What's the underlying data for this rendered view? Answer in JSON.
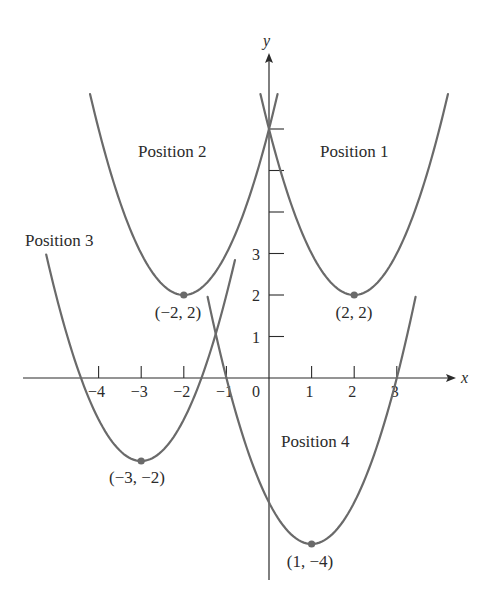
{
  "figure": {
    "axes": {
      "x_label": "x",
      "y_label": "y",
      "x_ticks": [
        {
          "value": -4,
          "label": "−4"
        },
        {
          "value": -3,
          "label": "−3"
        },
        {
          "value": -2,
          "label": "−2"
        },
        {
          "value": -1,
          "label": "−1"
        },
        {
          "value": 0,
          "label": "0"
        },
        {
          "value": 1,
          "label": "1"
        },
        {
          "value": 2,
          "label": "2"
        },
        {
          "value": 3,
          "label": "3"
        }
      ],
      "y_ticks": [
        {
          "value": 1,
          "label": "1"
        },
        {
          "value": 2,
          "label": "2"
        },
        {
          "value": 3,
          "label": "3"
        },
        {
          "value": 4,
          "label": ""
        },
        {
          "value": 5,
          "label": ""
        },
        {
          "value": 6,
          "label": ""
        }
      ],
      "x_range": [
        -5.8,
        4.4
      ],
      "y_range": [
        -4.9,
        7.9
      ]
    },
    "curves": [
      {
        "name": "Position 1",
        "label": "Position 1",
        "equation": "y = (x - 2)^2 + 2",
        "h": 2,
        "k": 2,
        "x_from": -0.2,
        "x_to": 4.2,
        "vertex_label": "(2, 2)"
      },
      {
        "name": "Position 2",
        "label": "Position 2",
        "equation": "y = (x + 2)^2 + 2",
        "h": -2,
        "k": 2,
        "x_from": -4.2,
        "x_to": 0.2,
        "vertex_label": "(−2, 2)"
      },
      {
        "name": "Position 3",
        "label": "Position 3",
        "equation": "y = (x + 3)^2 - 2",
        "h": -3,
        "k": -2,
        "x_from": -5.23,
        "x_to": -0.8,
        "vertex_label": "(−3, −2)"
      },
      {
        "name": "Position 4",
        "label": "Position 4",
        "equation": "y = (x - 1)^2 - 4",
        "h": 1,
        "k": -4,
        "x_from": -1.44,
        "x_to": 3.44,
        "vertex_label": "(1, −4)"
      }
    ],
    "colors": {
      "curve": "#6a6a6a",
      "axis": "#2b2b2b",
      "text": "#2b2b2b"
    }
  }
}
